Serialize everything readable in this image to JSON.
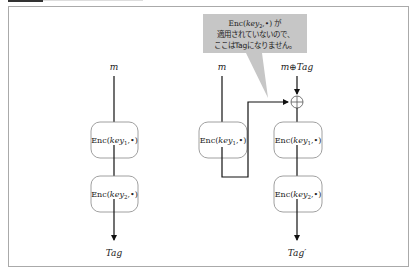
{
  "header": {
    "title": ""
  },
  "colors": {
    "frame_border": "#aaaaaa",
    "box_border": "#888888",
    "arrow": "#111111",
    "callout_fill": "#c6c6c6"
  },
  "diagram": {
    "left_column": {
      "input": "m",
      "boxes": [
        "Enc(key1,•)",
        "Enc(key2,•)"
      ],
      "output": "Tag"
    },
    "middle_column": {
      "input": "m",
      "boxes": [
        "Enc(key1,•)"
      ]
    },
    "right_column": {
      "input": "m⊕Tag",
      "xor_symbol": "⊕",
      "boxes": [
        "Enc(key1,•)",
        "Enc(key2,•)"
      ],
      "output": "Tag′"
    },
    "callout": {
      "lines": [
        "Enc(key2,•) が",
        "適用されていないので、",
        "ここはTagになりません。"
      ]
    }
  }
}
